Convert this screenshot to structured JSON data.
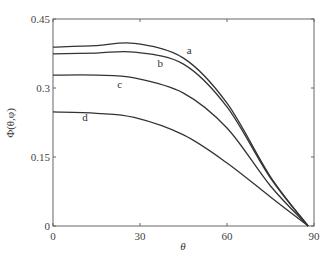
{
  "chart_data": {
    "type": "line",
    "title": "",
    "xlabel": "θ",
    "ylabel": "Φ(θ,φ)",
    "xlim": [
      0,
      90
    ],
    "ylim": [
      0,
      0.45
    ],
    "xticks": [
      0,
      30,
      60,
      90
    ],
    "xtick_labels": [
      "0",
      "30",
      "60",
      "90"
    ],
    "yticks": [
      0,
      0.15,
      0.3,
      0.45
    ],
    "ytick_labels": [
      "0",
      "0.15",
      "0.3",
      "0.45"
    ],
    "grid": false,
    "legend": "inline labels",
    "x": [
      0,
      15,
      28,
      45,
      60,
      75,
      88
    ],
    "series": [
      {
        "name": "a",
        "values": [
          0.389,
          0.392,
          0.397,
          0.365,
          0.267,
          0.107,
          0.0
        ]
      },
      {
        "name": "b",
        "values": [
          0.374,
          0.376,
          0.378,
          0.352,
          0.259,
          0.104,
          0.0
        ]
      },
      {
        "name": "c",
        "values": [
          0.328,
          0.328,
          0.322,
          0.289,
          0.213,
          0.087,
          0.0
        ]
      },
      {
        "name": "d",
        "values": [
          0.248,
          0.245,
          0.236,
          0.198,
          0.137,
          0.063,
          0.0
        ]
      }
    ],
    "curve_labels": [
      {
        "text": "a",
        "x": 47,
        "y": 0.375
      },
      {
        "text": "b",
        "x": 37,
        "y": 0.345
      },
      {
        "text": "c",
        "x": 23,
        "y": 0.3
      },
      {
        "text": "d",
        "x": 11,
        "y": 0.228
      }
    ]
  }
}
